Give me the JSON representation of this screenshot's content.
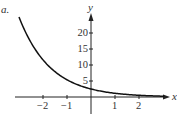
{
  "panel_label": "a.",
  "chart_data": {
    "type": "line",
    "title": "",
    "xlabel": "x",
    "ylabel": "y",
    "xlim": [
      -3.1,
      3.3
    ],
    "ylim": [
      -2,
      27
    ],
    "grid": false,
    "x_ticks": [
      -2,
      -1,
      1,
      2
    ],
    "x_tick_labels": [
      "−2",
      "−1",
      "1",
      "2"
    ],
    "y_ticks": [
      5,
      10,
      15,
      20
    ],
    "y_tick_labels": [
      "5",
      "10",
      "15",
      "20"
    ],
    "series": [
      {
        "name": "exponential decay curve",
        "x": [
          -3.0,
          -2.5,
          -2.0,
          -1.5,
          -1.0,
          -0.5,
          0.0,
          0.5,
          1.0,
          1.5,
          2.0,
          2.5,
          3.0
        ],
        "y": [
          25.0,
          17.1,
          11.6,
          7.9,
          5.4,
          3.7,
          2.5,
          1.7,
          1.16,
          0.79,
          0.54,
          0.37,
          0.25
        ]
      }
    ],
    "legend": null
  },
  "colors": {
    "axis": "#222222",
    "curve": "#111111",
    "text": "#333333"
  }
}
